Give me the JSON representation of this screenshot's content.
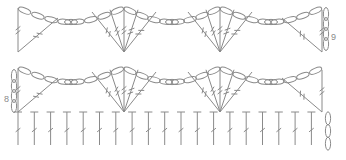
{
  "diagram": {
    "type": "crochet-stitch-chart",
    "stroke_color": "#8a8a8a",
    "row_labels": [
      {
        "text": "9",
        "x": 332,
        "y": 38
      },
      {
        "text": "8",
        "x": 5,
        "y": 100
      }
    ],
    "foundation_row": {
      "stitch": "treble",
      "count": 19,
      "x_start": 18,
      "x_step": 16.3,
      "top": 112,
      "bottom": 145
    },
    "turning_chain": {
      "x": 328,
      "top": 112,
      "bottom": 150,
      "loops": 3
    },
    "fan_rows": [
      {
        "row": 9,
        "base_y": 52,
        "top_y": 8,
        "fan_centers": [
          124,
          220
        ],
        "fan_stitches": 5
      },
      {
        "row": 8,
        "base_y": 112,
        "top_y": 68,
        "fan_centers": [
          124,
          220
        ],
        "fan_stitches": 5
      }
    ]
  }
}
